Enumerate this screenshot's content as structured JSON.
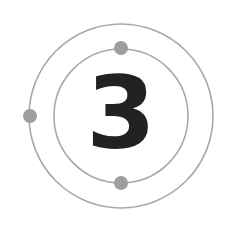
{
  "diagram": {
    "type": "atom-shell-diagram",
    "number": "3",
    "shells": [
      {
        "name": "inner-shell",
        "radius": 67,
        "electrons": 2
      },
      {
        "name": "outer-shell",
        "radius": 92,
        "electrons": 1
      }
    ],
    "colors": {
      "background": "#ffffff",
      "orbit": "#a8a8a8",
      "electron": "#9e9e9e",
      "digit": "#222222"
    }
  }
}
